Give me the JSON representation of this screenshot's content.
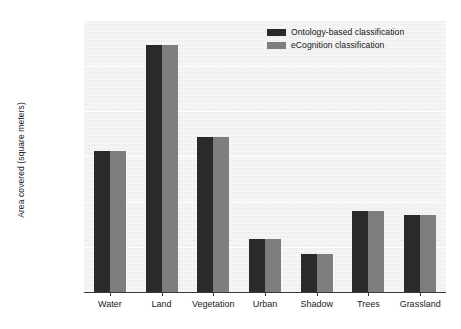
{
  "chart_data": {
    "type": "bar",
    "title": "",
    "xlabel": "",
    "ylabel": "Area covered (square meters)",
    "categories": [
      "Water",
      "Land",
      "Vegetation",
      "Urban",
      "Shadow",
      "Trees",
      "Grassland"
    ],
    "series": [
      {
        "name": "Ontology-based classification",
        "color": "#2a2a2a",
        "values": [
          1560000,
          2720000,
          1710000,
          580000,
          420000,
          890000,
          850000
        ]
      },
      {
        "name": "eCognition classification",
        "color": "#7e7e7e",
        "values": [
          1560000,
          2720000,
          1710000,
          580000,
          420000,
          890000,
          850000
        ]
      }
    ],
    "ylim": [
      0,
      3000000
    ],
    "yticks": [
      0,
      500000,
      1000000,
      1500000,
      2000000,
      2500000,
      3000000
    ],
    "ytick_labels": [
      "0",
      "500,000",
      "1,000,000",
      "1,500,000",
      "2,000,000",
      "2,500,000",
      "3,000,000"
    ],
    "grid": true,
    "legend_position": "top-right",
    "plot_background": "#f1f1f1"
  },
  "legend": {
    "items": [
      {
        "label": "Ontology-based classification",
        "color": "#2a2a2a"
      },
      {
        "label": "eCognition classification",
        "color": "#7e7e7e"
      }
    ]
  }
}
